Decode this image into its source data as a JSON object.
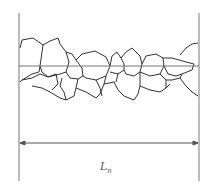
{
  "diagram": {
    "label": {
      "main": "L",
      "subscript": "n"
    },
    "colors": {
      "stroke": "#333333",
      "line": "#777777",
      "background": "#ffffff"
    }
  }
}
